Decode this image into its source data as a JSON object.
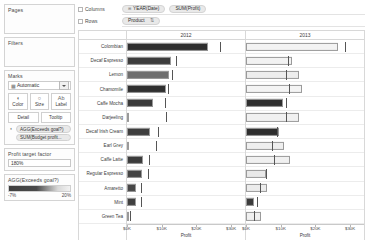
{
  "sidebar": {
    "pages": {
      "title": "Pages"
    },
    "filters": {
      "title": "Filters"
    },
    "marks": {
      "title": "Marks",
      "type_icon": "bar-chart-icon",
      "type_label": "Automatic",
      "buttons": [
        {
          "name": "color",
          "label": "Color",
          "glyph": "◐"
        },
        {
          "name": "size",
          "label": "Size",
          "glyph": "○"
        },
        {
          "name": "label",
          "label": "Label",
          "glyph": "Ab"
        }
      ],
      "buttons2": [
        {
          "name": "detail",
          "label": "Detail"
        },
        {
          "name": "tooltip",
          "label": "Tooltip"
        }
      ],
      "pills": [
        {
          "icon": "color-icon",
          "label": "AGG(Exceeds goal?)"
        },
        {
          "icon": "",
          "label": "SUM(Budget profit..."
        }
      ]
    },
    "parameter": {
      "title": "Profit target factor",
      "value": "180%"
    },
    "legend": {
      "title": "AGG(Exceeds goal?)",
      "min_label": "-7%",
      "max_label": "20%",
      "ramp_dark": "#3f3f3f",
      "ramp_light": "#f2f2f2"
    }
  },
  "shelves": {
    "columns": {
      "label": "Columns",
      "pills": [
        {
          "prefix": "⊞",
          "label": "YEAR(Date)"
        },
        {
          "prefix": "",
          "label": "SUM(Profit)"
        }
      ]
    },
    "rows": {
      "label": "Rows",
      "pills": [
        {
          "prefix": "",
          "label": "Product",
          "sort": "⇅"
        }
      ]
    }
  },
  "chart_data": {
    "type": "bar",
    "title": "",
    "xlabel": "Profit",
    "ylabel": "",
    "categories": [
      "Colombian",
      "Decaf Espresso",
      "Lemon",
      "Chamomile",
      "Caffe Mocha",
      "Darjeeling",
      "Decaf Irish Cream",
      "Earl Grey",
      "Caffe Latte",
      "Regular Espresso",
      "Amaretto",
      "Mint",
      "Green Tea"
    ],
    "panes": [
      {
        "name": "2012",
        "xlim": [
          0,
          34
        ],
        "ticks": [
          0,
          10,
          20,
          30
        ],
        "tick_labels": [
          "$0K",
          "$10K",
          "$20K",
          "$30K"
        ],
        "bars": [
          {
            "value": 23.4,
            "color": "#2e2e2e",
            "goal": 26.8
          },
          {
            "value": 12.6,
            "color": "#3c3c3c",
            "goal": 14.2
          },
          {
            "value": 12.0,
            "color": "#6e6e6e",
            "goal": 13.1
          },
          {
            "value": 11.2,
            "color": "#2f2f2f",
            "goal": 11.9
          },
          {
            "value": 7.6,
            "color": "#3a3a3a",
            "goal": 11.0
          },
          {
            "value": 0.0,
            "color": "#ffffff",
            "goal": 11.1
          },
          {
            "value": 6.7,
            "color": "#3e3e3e",
            "goal": 9.0
          },
          {
            "value": 0.0,
            "color": "#ffffff",
            "goal": 8.3
          },
          {
            "value": 4.6,
            "color": "#3b3b3b",
            "goal": 6.4
          },
          {
            "value": 4.4,
            "color": "#444444",
            "goal": 6.0
          },
          {
            "value": 2.6,
            "color": "#474747",
            "goal": 3.9
          },
          {
            "value": 2.7,
            "color": "#3f3f3f",
            "goal": 4.0
          },
          {
            "value": 0.0,
            "color": "#ffffff",
            "goal": 1.0
          }
        ]
      },
      {
        "name": "2013",
        "xlim": [
          0,
          34
        ],
        "ticks": [
          0,
          10,
          20,
          30
        ],
        "tick_labels": [
          "$0K",
          "$10K",
          "$20K",
          "$30K"
        ],
        "bars": [
          {
            "value": 26.6,
            "color": "#f3f3f3",
            "goal": 28.6
          },
          {
            "value": 13.2,
            "color": "#f2f2f2",
            "goal": 12.0
          },
          {
            "value": 15.2,
            "color": "#ededed",
            "goal": 11.5
          },
          {
            "value": 16.0,
            "color": "#f4f4f4",
            "goal": 12.3
          },
          {
            "value": 10.7,
            "color": "#2f2f2f",
            "goal": 11.6
          },
          {
            "value": 15.3,
            "color": "#f1f1f1",
            "goal": 11.5
          },
          {
            "value": 9.6,
            "color": "#2e2e2e",
            "goal": 9.0
          },
          {
            "value": 11.0,
            "color": "#efefef",
            "goal": 7.6
          },
          {
            "value": 12.6,
            "color": "#f0f0f0",
            "goal": 8.2
          },
          {
            "value": 5.9,
            "color": "#e9e9e9",
            "goal": 5.7
          },
          {
            "value": 6.0,
            "color": "#ececec",
            "goal": 4.0
          },
          {
            "value": 2.4,
            "color": "#3b3b3b",
            "goal": 3.2
          },
          {
            "value": 4.3,
            "color": "#f0f0f0",
            "goal": 2.3
          }
        ]
      }
    ]
  }
}
